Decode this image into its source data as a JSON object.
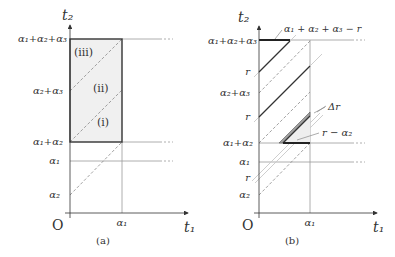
{
  "panels": [
    {
      "id": "a",
      "caption": "(a)",
      "axis_labels": {
        "y": "t₂",
        "x": "t₁",
        "origin": "O"
      },
      "y_ticks": {
        "a123": "α₁+α₂+α₃",
        "a23": "α₂+α₃",
        "a12": "α₁+α₂",
        "a1": "α₁",
        "a2": "α₂"
      },
      "x_ticks": {
        "a1": "α₁"
      },
      "regions": [
        "(iii)",
        "(ii)",
        "(i)"
      ]
    },
    {
      "id": "b",
      "caption": "(b)",
      "axis_labels": {
        "y": "t₂",
        "x": "t₁",
        "origin": "O"
      },
      "y_ticks": {
        "a123": "α₁+α₂+α₃",
        "r_upper": "r",
        "a23": "α₂+α₃",
        "r_mid": "r",
        "a12": "α₁+α₂",
        "a1": "α₁",
        "r_lower": "r",
        "a2": "α₂"
      },
      "x_ticks": {
        "a1": "α₁"
      },
      "annotations": {
        "top": "α₁ + α₂ + α₃ − r",
        "delta_r": "Δr",
        "r_minus_a2": "r − α₂"
      }
    }
  ],
  "colors": {
    "shade": "#f0f0f0",
    "line": "#333333",
    "grey": "#999999",
    "dashed": "#8a8a8a",
    "band": "#b5b5b5"
  }
}
